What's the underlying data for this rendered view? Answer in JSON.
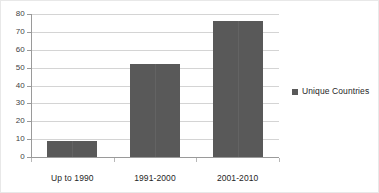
{
  "chart_data": {
    "type": "bar",
    "title": "",
    "subtitle": "",
    "xlabel": "",
    "ylabel": "",
    "categories": [
      "Up to 1990",
      "1991-2000",
      "2001-2010"
    ],
    "series": [
      {
        "name": "Unique Countries",
        "values": [
          9,
          52,
          76
        ],
        "color": "#595959"
      }
    ],
    "ylim": [
      0,
      80
    ],
    "ytick_labels": [
      "0",
      "10",
      "20",
      "30",
      "40",
      "50",
      "60",
      "70",
      "80"
    ],
    "ytick_values": [
      0,
      10,
      20,
      30,
      40,
      50,
      60,
      70,
      80
    ],
    "grid": true,
    "grid_axis": "y",
    "legend": {
      "position": "right",
      "entries": [
        {
          "label": "Unique Countries",
          "marker": "square",
          "color": "#595959"
        }
      ]
    },
    "colors": {
      "bar": "#595959",
      "gridline": "#d4d4d4",
      "axis": "#9a9a9a",
      "text": "#262626",
      "background": "#ffffff",
      "border": "#e8e8e8"
    }
  }
}
